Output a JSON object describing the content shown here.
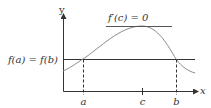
{
  "diagram": {
    "axes": {
      "x_label": "x",
      "y_label": "y"
    },
    "labels": {
      "horizontal_line": "f(a) = f(b)",
      "tangent": "f′(c) = 0",
      "point_a": "a",
      "point_c": "c",
      "point_b": "b"
    },
    "colors": {
      "axes": "#333333",
      "curve": "#8a8a8a",
      "lines": "#333333",
      "text": "#333333"
    }
  }
}
